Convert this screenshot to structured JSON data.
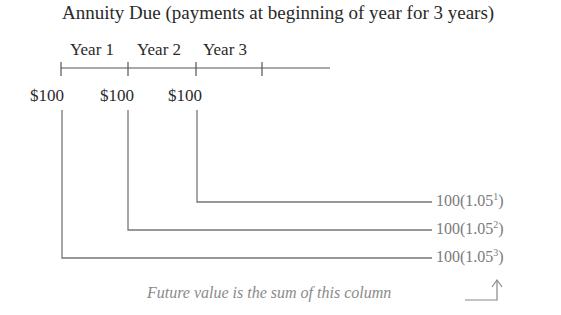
{
  "title": "Annuity Due (payments at beginning of year for 3 years)",
  "timeline": {
    "years": [
      "Year 1",
      "Year 2",
      "Year 3"
    ],
    "payments": [
      "$100",
      "$100",
      "$100"
    ]
  },
  "future_values": [
    {
      "base": "100(1.05",
      "exp": "1",
      "close": ")"
    },
    {
      "base": "100(1.05",
      "exp": "2",
      "close": ")"
    },
    {
      "base": "100(1.05",
      "exp": "3",
      "close": ")"
    }
  ],
  "caption": "Future value is the sum of this column",
  "colors": {
    "text": "#2a2a2a",
    "lines": "#6e6e6e",
    "fv_text": "#7a7a7a"
  }
}
